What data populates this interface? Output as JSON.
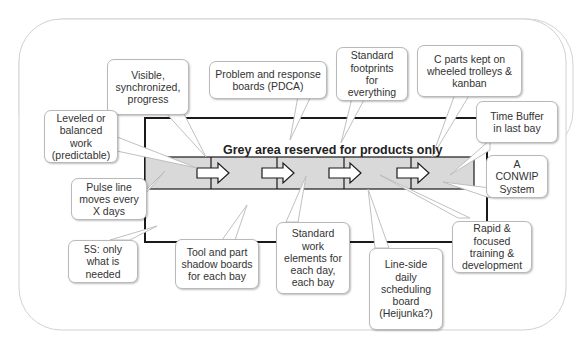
{
  "diagram": {
    "band_title": "Grey area reserved for products only",
    "colors": {
      "band_fill": "#d9d9d9",
      "frame_line": "#111111",
      "outer_border": "#c8c8c8",
      "callout_border": "#b9b9b9",
      "text": "#333333"
    },
    "flow_arrows": [
      "arrow-bay-1",
      "arrow-bay-2",
      "arrow-bay-3",
      "arrow-bay-4"
    ],
    "callouts": [
      {
        "id": "visible-progress",
        "text": "Visible,\nsynchronized,\nprogress"
      },
      {
        "id": "problem-boards",
        "text": "Problem and response\nboards (PDCA)"
      },
      {
        "id": "standard-footprints",
        "text": "Standard\nfootprints\nfor\neverything"
      },
      {
        "id": "c-parts",
        "text": "C parts kept on\nwheeled trolleys &\nkanban"
      },
      {
        "id": "leveled-work",
        "text": "Leveled or\nbalanced\nwork\n(predictable)"
      },
      {
        "id": "time-buffer",
        "text": "Time Buffer\nin last bay"
      },
      {
        "id": "conwip",
        "text": "A\nCONWIP\nSystem"
      },
      {
        "id": "pulse-line",
        "text": "Pulse line\nmoves every\nX days"
      },
      {
        "id": "5s",
        "text": "5S: only\nwhat is\nneeded"
      },
      {
        "id": "shadow-boards",
        "text": "Tool and part\nshadow boards\nfor each bay"
      },
      {
        "id": "standard-work",
        "text": "Standard\nwork\nelements for\neach day,\neach bay"
      },
      {
        "id": "heijunka",
        "text": "Line-side\ndaily\nscheduling\nboard\n(Heijunka?)"
      },
      {
        "id": "training",
        "text": "Rapid &\nfocused\ntraining &\ndevelopment"
      }
    ]
  }
}
